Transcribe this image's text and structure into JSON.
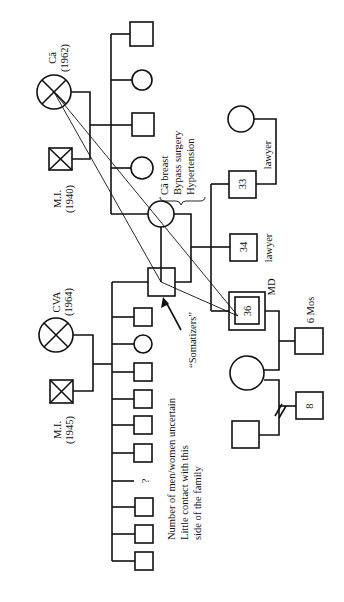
{
  "colors": {
    "ink": "#111111",
    "background": "#ffffff"
  },
  "upper_family": {
    "mother": {
      "symbol": "deceased-female",
      "cause": "Cā",
      "year": "(1962)"
    },
    "father": {
      "symbol": "deceased-male",
      "cause": "M.I.",
      "year": "(1940)"
    },
    "children": [
      "male",
      "female",
      "male",
      "female",
      "female-index-parent"
    ]
  },
  "lower_family": {
    "mother": {
      "symbol": "deceased-female",
      "cause": "CVA",
      "year": "(1964)"
    },
    "father": {
      "symbol": "deceased-male",
      "cause": "M.I.",
      "year": "(1945)"
    },
    "children": [
      "male-index-parent",
      "male",
      "female",
      "male",
      "male",
      "male",
      "male",
      "unknown",
      "male",
      "male",
      "male"
    ],
    "unknown_marker": "?"
  },
  "parent_couple": {
    "mother_notes": [
      "Cā breast",
      "Bypass surgery",
      "Hypertension"
    ],
    "somatizers_label": "“Somatizers”"
  },
  "siblings": [
    {
      "age": "33",
      "occupation": "lawyer"
    },
    {
      "age": "34",
      "occupation": "lawyer"
    },
    {
      "age": "36",
      "occupation": "MD",
      "identified_patient": true
    }
  ],
  "third_generation": {
    "child_of_36": {
      "age_label": "6 Mos"
    },
    "child_of_wife_previous": {
      "age": "8"
    },
    "divorce_marker": "//"
  },
  "annotations": {
    "uncertain_note": [
      "Number of men/women uncertain",
      "Little contact with this",
      "side of the family"
    ]
  }
}
